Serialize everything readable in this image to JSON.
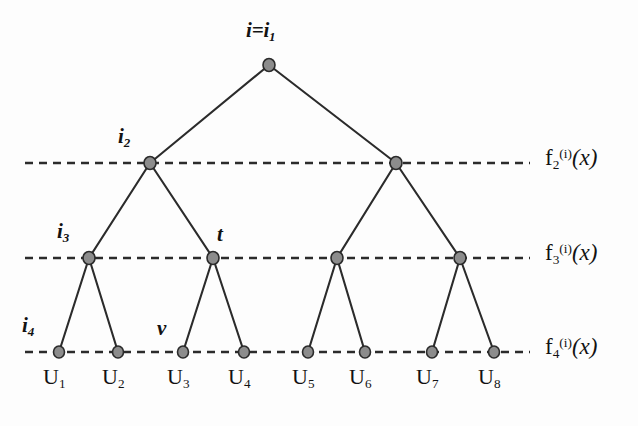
{
  "figure": {
    "type": "binary-tree-diagram",
    "background_color": "#fdfdfd",
    "node_fill_color": "#8c8c8c",
    "node_stroke_color": "#2b2b2b",
    "edge_color": "#2b2b2b",
    "dashed_line_color": "#2b2b2b"
  },
  "root": {
    "label_prefix": "i",
    "label_equals": "=",
    "label_base": "i",
    "label_sub": "1",
    "full_text": "i=i1"
  },
  "node_labels": [
    {
      "base": "i",
      "sub": "2",
      "full_text": "i2"
    },
    {
      "base": "i",
      "sub": "3",
      "full_text": "i3"
    },
    {
      "base": "t",
      "sub": "",
      "full_text": "t"
    },
    {
      "base": "i",
      "sub": "4",
      "full_text": "i4"
    },
    {
      "base": "v",
      "sub": "",
      "full_text": "v"
    }
  ],
  "level_lines": [
    {
      "f": "f",
      "sub": "2",
      "sup": "(i)",
      "arg": "(x)",
      "full_text": "f2(i)(x)"
    },
    {
      "f": "f",
      "sub": "3",
      "sup": "(i)",
      "arg": "(x)",
      "full_text": "f3(i)(x)"
    },
    {
      "f": "f",
      "sub": "4",
      "sup": "(i)",
      "arg": "(x)",
      "full_text": "f4(i)(x)"
    }
  ],
  "leaves": [
    {
      "base": "U",
      "sub": "1"
    },
    {
      "base": "U",
      "sub": "2"
    },
    {
      "base": "U",
      "sub": "3"
    },
    {
      "base": "U",
      "sub": "4"
    },
    {
      "base": "U",
      "sub": "5"
    },
    {
      "base": "U",
      "sub": "6"
    },
    {
      "base": "U",
      "sub": "7"
    },
    {
      "base": "U",
      "sub": "8"
    }
  ],
  "geometry": {
    "root_node": {
      "x": 269,
      "y": 65
    },
    "level2_nodes": [
      {
        "x": 150,
        "y": 163
      },
      {
        "x": 396,
        "y": 163
      }
    ],
    "level3_nodes": [
      {
        "x": 89,
        "y": 258
      },
      {
        "x": 213,
        "y": 258
      },
      {
        "x": 337,
        "y": 258
      },
      {
        "x": 460,
        "y": 258
      }
    ],
    "level4_nodes": [
      {
        "x": 59,
        "y": 352
      },
      {
        "x": 118,
        "y": 352
      },
      {
        "x": 183,
        "y": 352
      },
      {
        "x": 244,
        "y": 352
      },
      {
        "x": 308,
        "y": 352
      },
      {
        "x": 365,
        "y": 352
      },
      {
        "x": 432,
        "y": 352
      },
      {
        "x": 494,
        "y": 352
      }
    ],
    "dash_line_y": [
      163,
      258,
      352
    ],
    "dash_x_start": 25,
    "dash_x_end": 530,
    "node_radius": 5.5
  }
}
